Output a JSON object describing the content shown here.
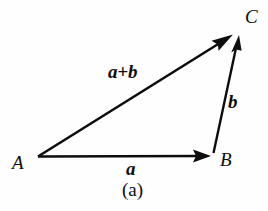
{
  "figure": {
    "caption": "(a)",
    "background_color": "#fefefe",
    "ink_color": "#0d0d0d",
    "width": 268,
    "height": 211
  },
  "points": {
    "a_label": "A",
    "b_label": "B",
    "c_label": "C"
  },
  "vectors": {
    "a_label": "a",
    "b_label": "b",
    "sum_label": "a+b"
  },
  "diagram_data": {
    "type": "vector-triangle",
    "title": "(a)",
    "description": "Triangle law of vector addition: vector a from A to B, vector b from B to C, and resultant a+b from A to C.",
    "vertices": [
      {
        "name": "A",
        "x": 38,
        "y": 157
      },
      {
        "name": "B",
        "x": 214,
        "y": 155
      },
      {
        "name": "C",
        "x": 239,
        "y": 33
      }
    ],
    "arrows": [
      {
        "name": "a",
        "from": "A",
        "to": "B",
        "label": "a",
        "x1": 38,
        "y1": 157,
        "x2": 211,
        "y2": 156
      },
      {
        "name": "b",
        "from": "B",
        "to": "C",
        "label": "b",
        "x1": 213,
        "y1": 153,
        "x2": 238,
        "y2": 36
      },
      {
        "name": "a+b",
        "from": "A",
        "to": "C",
        "label": "a+b",
        "x1": 38,
        "y1": 156,
        "x2": 233,
        "y2": 34
      }
    ]
  }
}
